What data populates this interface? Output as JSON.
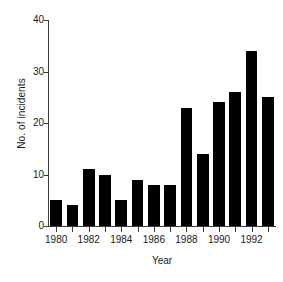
{
  "chart_data": {
    "type": "bar",
    "title": "",
    "xlabel": "Year",
    "ylabel": "No. of incidents",
    "categories": [
      "1980",
      "1981",
      "1982",
      "1983",
      "1984",
      "1985",
      "1986",
      "1987",
      "1988",
      "1989",
      "1990",
      "1991",
      "1992",
      "1993"
    ],
    "values": [
      5,
      4,
      11,
      10,
      5,
      9,
      8,
      8,
      23,
      14,
      24,
      26,
      34,
      25
    ],
    "ylim": [
      0,
      40
    ],
    "yticks": [
      0,
      10,
      20,
      30,
      40
    ],
    "ytick_labels": [
      "0",
      "10",
      "20",
      "30",
      "40"
    ],
    "xtick_labels": [
      "1980",
      "1982",
      "1984",
      "1986",
      "1988",
      "1990",
      "1992"
    ],
    "xtick_categories": [
      "1980",
      "1982",
      "1984",
      "1986",
      "1988",
      "1990",
      "1992"
    ],
    "grid": false,
    "legend": null,
    "bar_color": "#000000",
    "axis_color": "#3b3b3b",
    "background": "#ffffff"
  }
}
